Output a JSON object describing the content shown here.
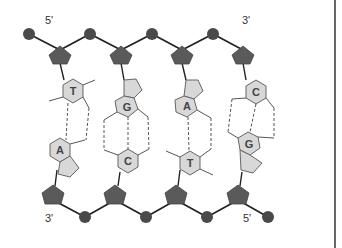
{
  "diagram": {
    "type": "dna-double-strand",
    "labels": {
      "top_left": "5'",
      "top_right": "3'",
      "bottom_left": "3'",
      "bottom_right": "5'"
    },
    "base_pairs": [
      {
        "top": "T",
        "bottom": "A",
        "hydrogen_bonds": 2
      },
      {
        "top": "G",
        "bottom": "C",
        "hydrogen_bonds": 3
      },
      {
        "top": "A",
        "bottom": "T",
        "hydrogen_bonds": 2
      },
      {
        "top": "C",
        "bottom": "G",
        "hydrogen_bonds": 3
      }
    ],
    "colors": {
      "phosphate": "#4a4a4a",
      "sugar": "#5a5a5a",
      "base_fill": "#d8d8d8",
      "base_stroke": "#666666",
      "backbone_line": "#222222",
      "bond_dash": "#555555"
    }
  }
}
